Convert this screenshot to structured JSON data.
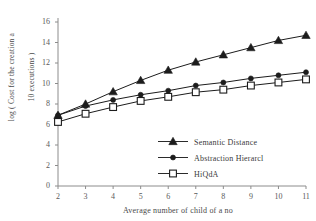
{
  "chart_data": {
    "type": "line",
    "title": "",
    "xlabel": "Average number of child of a no",
    "ylabel_line1": "log ( Cost for the creation a",
    "ylabel_line2": "10 executions )",
    "x": [
      2,
      3,
      4,
      5,
      6,
      7,
      8,
      9,
      10,
      11
    ],
    "xtick_labels": [
      "2",
      "3",
      "4",
      "5",
      "6",
      "7",
      "8",
      "9",
      "10",
      "11"
    ],
    "ytick_labels": [
      "0",
      "2",
      "4",
      "6",
      "8",
      "10",
      "12",
      "14",
      "16"
    ],
    "ytick_values": [
      0,
      2,
      4,
      6,
      8,
      10,
      12,
      14,
      16
    ],
    "xlim": [
      2,
      11
    ],
    "ylim": [
      0,
      16
    ],
    "grid": false,
    "legend_position": "inside-lower-right",
    "series": [
      {
        "name": "Semantic Distance",
        "marker": "filled-triangle",
        "color": "#1c1c1c",
        "values": [
          6.9,
          8.0,
          9.2,
          10.3,
          11.3,
          12.1,
          12.8,
          13.5,
          14.2,
          14.7
        ]
      },
      {
        "name": "Abstraction Hierarcl",
        "marker": "filled-circle",
        "color": "#1c1c1c",
        "values": [
          6.9,
          7.8,
          8.4,
          8.9,
          9.3,
          9.8,
          10.1,
          10.5,
          10.8,
          11.1
        ]
      },
      {
        "name": "HiQdA",
        "marker": "open-square",
        "color": "#1c1c1c",
        "values": [
          6.25,
          7.05,
          7.7,
          8.3,
          8.7,
          9.15,
          9.4,
          9.8,
          10.1,
          10.4
        ]
      }
    ]
  }
}
